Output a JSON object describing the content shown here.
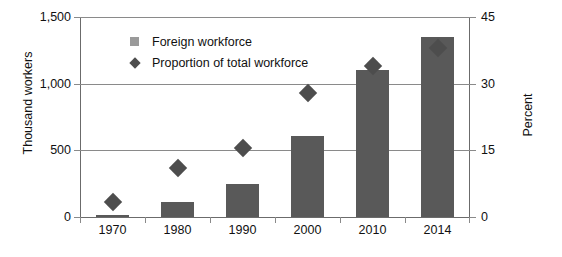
{
  "chart_data": {
    "type": "bar",
    "title": "",
    "subtitle": "",
    "xlabel": "",
    "ylabel": "Thousand workers",
    "y2label": "Percent",
    "categories": [
      "1970",
      "1980",
      "1990",
      "2000",
      "2010",
      "2014"
    ],
    "ylim": [
      0,
      1500
    ],
    "yticks": [
      "0",
      "500",
      "1,000",
      "1,500"
    ],
    "ytick_values": [
      0,
      500,
      1000,
      1500
    ],
    "y2lim": [
      0,
      45
    ],
    "y2ticks": [
      "0",
      "15",
      "30",
      "45"
    ],
    "y2tick_values": [
      0,
      15,
      30,
      45
    ],
    "grid": true,
    "legend_position": "upper-left-inside",
    "series": [
      {
        "name": "Foreign workforce",
        "type": "bar",
        "axis": "left",
        "unit": "thousand workers",
        "color": "#595959",
        "values": [
          15,
          115,
          245,
          610,
          1100,
          1350
        ]
      },
      {
        "name": "Proportion of total workforce",
        "type": "scatter",
        "marker": "diamond",
        "axis": "right",
        "unit": "percent",
        "color": "#4d4d4d",
        "values": [
          3.3,
          11.0,
          15.5,
          28.0,
          34.0,
          38.0
        ]
      }
    ],
    "legend": [
      "Foreign workforce",
      "Proportion of total workforce"
    ],
    "colors": {
      "bar": "#595959",
      "marker": "#4d4d4d",
      "legend_square": "#9a9a9a",
      "axis": "#6b6b6b",
      "grid": "#8a8a8a",
      "text": "#111111",
      "background": "#ffffff"
    }
  }
}
